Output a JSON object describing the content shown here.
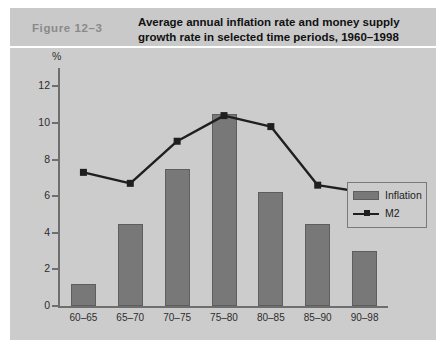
{
  "figure": {
    "number": "Figure  12–3",
    "title_line1": "Average annual inflation rate and money supply",
    "title_line2": "growth rate in selected time periods, 1960–1998"
  },
  "legend": {
    "position": "inside-right",
    "items": [
      {
        "label": "Inflation",
        "type": "bar",
        "color": "#787878"
      },
      {
        "label": "M2",
        "type": "line",
        "color": "#1f1f1f"
      }
    ]
  },
  "axis": {
    "y_unit_label": "%",
    "y_ticks": [
      "0",
      "2",
      "4",
      "6",
      "8",
      "10",
      "12"
    ],
    "x_ticks": [
      "60–65",
      "65–70",
      "70–75",
      "75–80",
      "80–85",
      "85–90",
      "90–98"
    ]
  },
  "colors": {
    "header_band": "#c9c9c9",
    "plot_background": "#cccccc",
    "bar_fill": "#787878",
    "line_stroke": "#1f1f1f",
    "axis": "#6e6e6e",
    "figure_number_text": "#8a8a8a"
  },
  "chart_data": {
    "type": "bar",
    "title": "Average annual inflation rate and money supply growth rate in selected time periods, 1960–1998",
    "subtitle": "Figure  12–3",
    "xlabel": "",
    "ylabel": "%",
    "ylim": [
      0,
      13
    ],
    "yticks": [
      0,
      2,
      4,
      6,
      8,
      10,
      12
    ],
    "grid": false,
    "legend_position": "inside-right",
    "categories": [
      "60–65",
      "65–70",
      "70–75",
      "75–80",
      "80–85",
      "85–90",
      "90–98"
    ],
    "series": [
      {
        "name": "Inflation",
        "type": "bar",
        "color": "#787878",
        "values": [
          1.2,
          4.5,
          7.5,
          10.5,
          6.2,
          4.5,
          3.0
        ]
      },
      {
        "name": "M2",
        "type": "line",
        "color": "#1f1f1f",
        "marker": "square",
        "values": [
          7.3,
          6.7,
          9.0,
          10.4,
          9.8,
          6.6,
          6.2
        ]
      }
    ]
  }
}
